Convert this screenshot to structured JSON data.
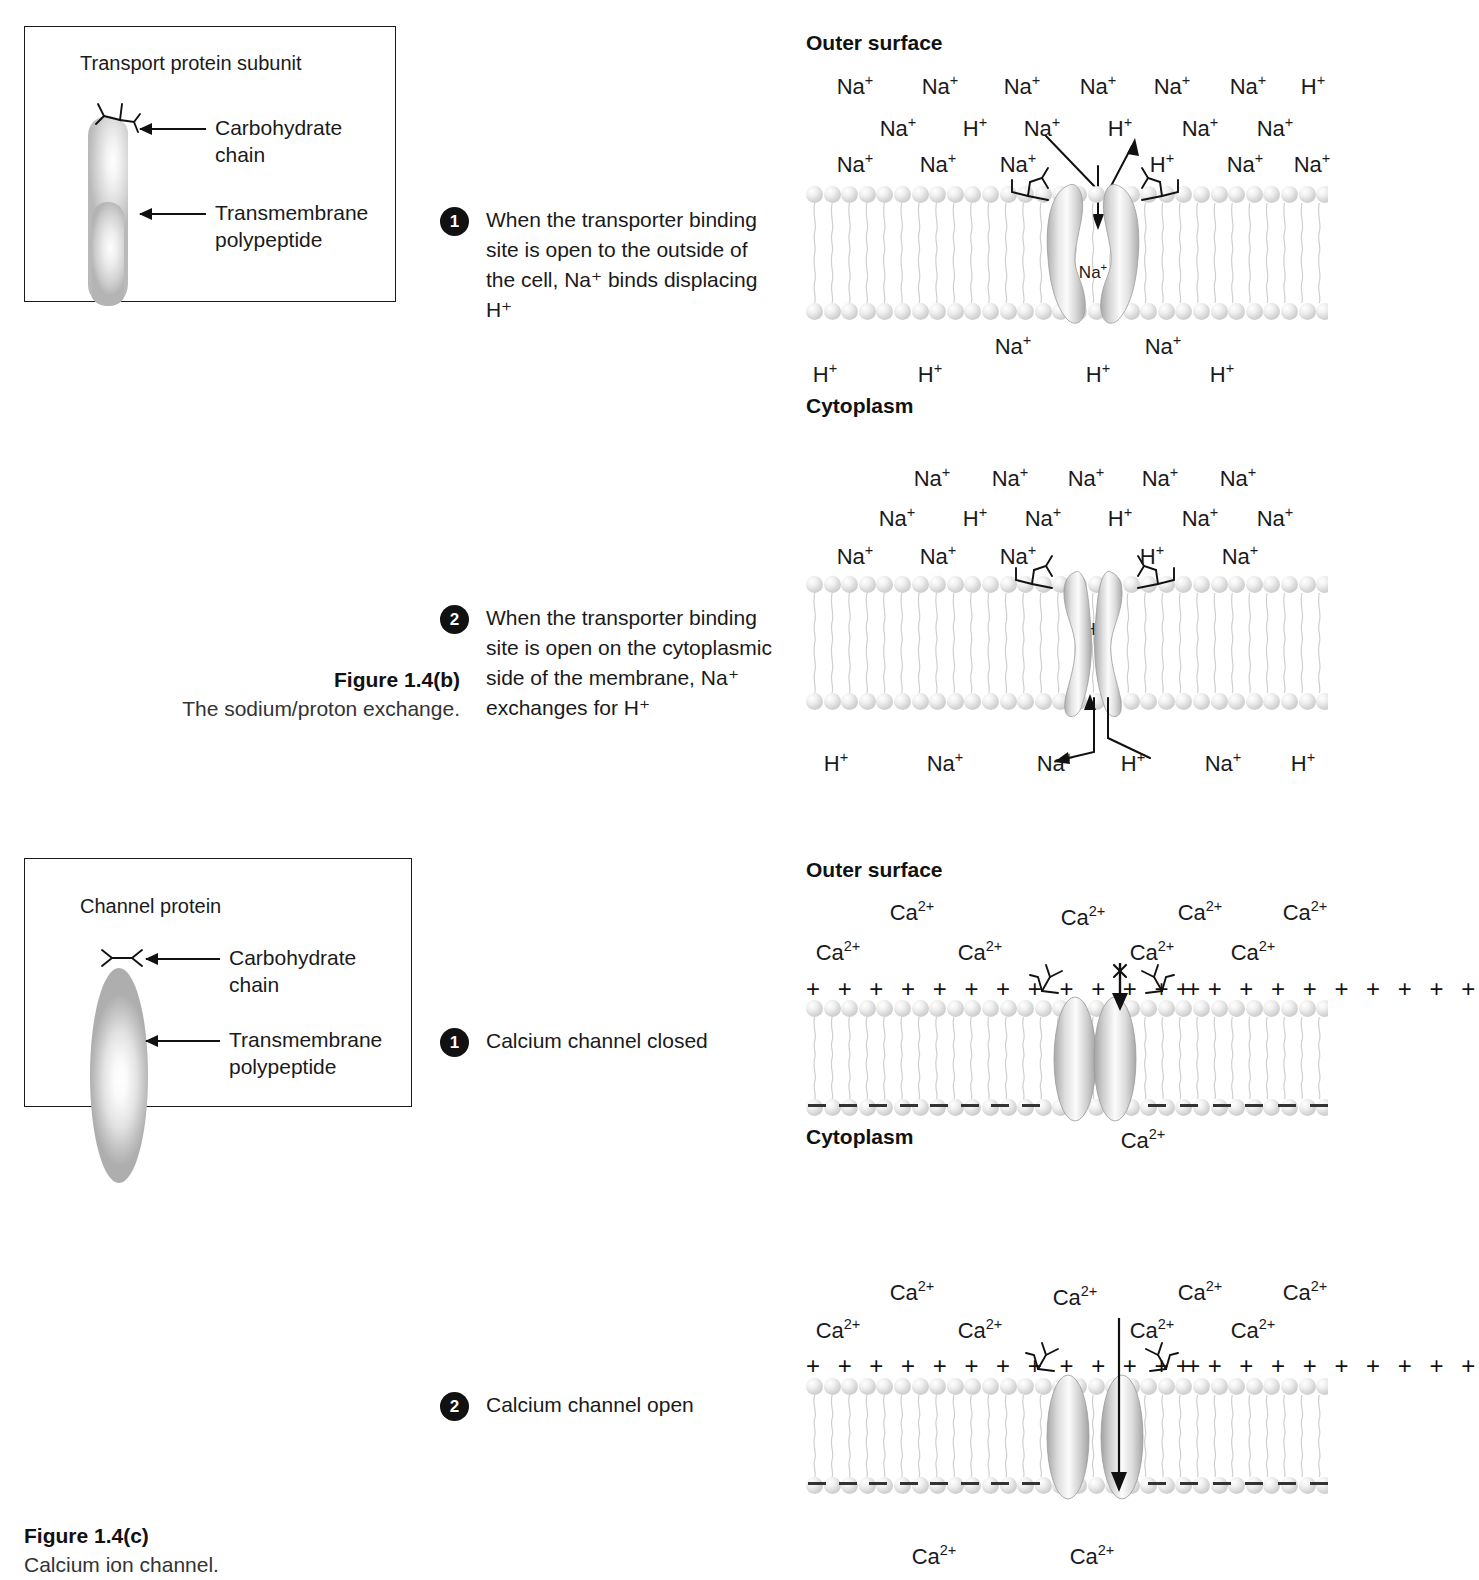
{
  "panel_b": {
    "legend": {
      "title": "Transport protein subunit",
      "label_carb": "Carbohydrate\nchain",
      "label_carb_line1": "Carbohydrate",
      "label_carb_line2": "chain",
      "label_tm_line1": "Transmembrane",
      "label_tm_line2": "polypeptide"
    },
    "steps": [
      {
        "number": "1",
        "lines": [
          "When the transporter binding",
          "site is open to the outside of",
          "the cell, Na⁺ binds displacing H⁺"
        ]
      },
      {
        "number": "2",
        "lines": [
          "When the transporter binding",
          "site is open on the cytoplasmic",
          "side of the membrane, Na⁺",
          "exchanges for H⁺"
        ]
      }
    ],
    "surface_top": "Outer surface",
    "surface_bottom": "Cytoplasm",
    "stage1": {
      "ions_row1": [
        "Na",
        "Na",
        "Na",
        "Na",
        "Na",
        "Na",
        "H"
      ],
      "ions_row2": [
        "Na",
        "H",
        "Na",
        "H",
        "Na",
        "Na"
      ],
      "ions_row3": [
        "Na",
        "Na",
        "Na",
        "H",
        "Na",
        "Na"
      ],
      "pore_ion": "Na",
      "ions_below": [
        "Na",
        "Na"
      ],
      "ions_cyto": [
        "H",
        "H",
        "H",
        "H"
      ]
    },
    "stage2": {
      "ions_row1": [
        "Na",
        "Na",
        "Na",
        "Na",
        "Na"
      ],
      "ions_row2": [
        "Na",
        "H",
        "Na",
        "H",
        "Na",
        "Na"
      ],
      "ions_row3": [
        "Na",
        "Na",
        "Na",
        "H",
        "Na"
      ],
      "pore_ion": "H",
      "ions_cyto": [
        "H",
        "Na",
        "Na",
        "H",
        "Na",
        "H"
      ]
    },
    "caption": {
      "title": "Figure 1.4(b)",
      "subtitle": "The sodium/proton exchange."
    }
  },
  "panel_c": {
    "legend": {
      "title": "Channel protein",
      "label_carb_line1": "Carbohydrate",
      "label_carb_line2": "chain",
      "label_tm_line1": "Transmembrane",
      "label_tm_line2": "polypeptide"
    },
    "steps": [
      {
        "number": "1",
        "lines": [
          "Calcium channel closed"
        ]
      },
      {
        "number": "2",
        "lines": [
          "Calcium channel open"
        ]
      }
    ],
    "surface_top": "Outer surface",
    "surface_bottom": "Cytoplasm",
    "stage1": {
      "ions_row1": [
        "Ca",
        "Ca",
        "Ca",
        "Ca"
      ],
      "ions_row2": [
        "Ca",
        "Ca",
        "Ca",
        "Ca"
      ],
      "ion_cyto": "Ca",
      "blocked": true
    },
    "stage2": {
      "ions_row1": [
        "Ca",
        "Ca",
        "Ca",
        "Ca"
      ],
      "ions_row2": [
        "Ca",
        "Ca",
        "Ca",
        "Ca"
      ],
      "ions_cyto": [
        "Ca",
        "Ca"
      ],
      "blocked": false
    },
    "charge_positive": "+ + + + + + + + + + + + + +",
    "caption": {
      "title": "Figure 1.4(c)",
      "subtitle": "Calcium ion channel."
    }
  },
  "ion_charges": {
    "Na": "+",
    "H": "+",
    "Ca": "2+"
  },
  "colors": {
    "ink": "#111111",
    "protein_mid": "#c8c8c8",
    "badge": "#111111"
  }
}
